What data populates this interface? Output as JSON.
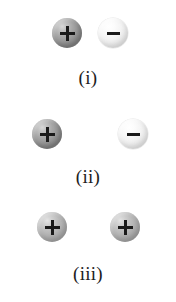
{
  "figure": {
    "background_color": "#ffffff",
    "panels": [
      {
        "label": "(i)",
        "charges": [
          {
            "sign": "+",
            "shade": "dark",
            "left": 52,
            "top": 18
          },
          {
            "sign": "−",
            "shade": "light",
            "left": 98,
            "top": 18
          }
        ],
        "row_top": 18,
        "caption_top": 68
      },
      {
        "label": "(ii)",
        "charges": [
          {
            "sign": "+",
            "shade": "dark",
            "left": 32,
            "top": 119
          },
          {
            "sign": "−",
            "shade": "light",
            "left": 118,
            "top": 119
          }
        ],
        "row_top": 119,
        "caption_top": 167
      },
      {
        "label": "(iii)",
        "charges": [
          {
            "sign": "+",
            "shade": "mid",
            "left": 37,
            "top": 212
          },
          {
            "sign": "+",
            "shade": "mid",
            "left": 110,
            "top": 212
          }
        ],
        "row_top": 212,
        "caption_top": 264
      }
    ]
  },
  "colors": {
    "glyph": "#1a1a1a",
    "caption": "#1d1d1d",
    "sphere_dark": "#949494",
    "sphere_mid": "#b4b4b4",
    "sphere_light": "#f2f2f2"
  }
}
